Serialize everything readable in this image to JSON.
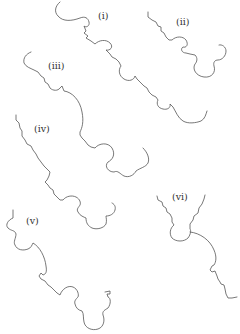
{
  "figure": {
    "background": "#ffffff",
    "stroke_color": "#555555",
    "panels": [
      {
        "id": "i",
        "label": "(i)"
      },
      {
        "id": "ii",
        "label": "(ii)"
      },
      {
        "id": "iii",
        "label": "(iii)"
      },
      {
        "id": "iv",
        "label": "(iv)"
      },
      {
        "id": "v",
        "label": "(v)"
      },
      {
        "id": "vi",
        "label": "(vi)"
      }
    ]
  }
}
